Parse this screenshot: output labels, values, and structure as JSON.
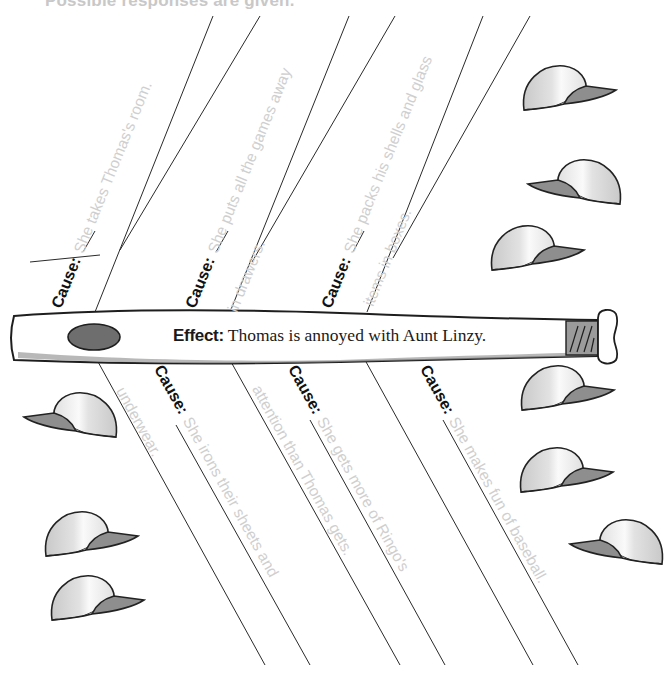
{
  "header": {
    "instruction_fragment": "Possible responses are given."
  },
  "diagram": {
    "type": "cause-and-effect (fishbone) organizer on a baseball bat",
    "effect": {
      "label": "Effect:",
      "text": "Thomas is annoyed with Aunt Linzy."
    },
    "cause_label": "Cause:",
    "causes_top": [
      {
        "line1": "She takes Thomas's room.",
        "line2": ""
      },
      {
        "line1": "She puts all the games away",
        "line2": "in drawers."
      },
      {
        "line1": "She packs his shells and glass",
        "line2": "items in boxes."
      }
    ],
    "causes_bottom": [
      {
        "line1": "She irons their sheets and",
        "line2": "underwear."
      },
      {
        "line1": "She gets more of Ringo's",
        "line2": "attention than Thomas gets."
      },
      {
        "line1": "She makes fun of baseball.",
        "line2": ""
      }
    ],
    "decorations": {
      "caps_right_top": 3,
      "caps_left_bottom": 3,
      "caps_right_bottom": 3
    }
  },
  "colors": {
    "line": "#2a2a2a",
    "answer_text": "#cfcfcf",
    "bat_fill": "#ffffff",
    "bat_shadow": "#9a9a9a",
    "grip": "#9b9b9b",
    "cap_brim": "#8c8c8c",
    "cap_crown": "#e6e6e6"
  }
}
